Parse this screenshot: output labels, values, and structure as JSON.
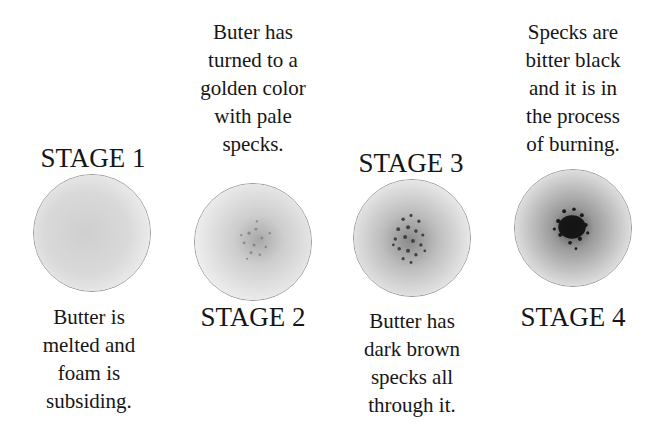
{
  "stages": [
    {
      "title": "STAGE 1",
      "description": "Butter is\nmelted and\nfoam is\nsubsiding.",
      "speck_color": "#b8b8b8",
      "speck_density": "none"
    },
    {
      "title": "STAGE 2",
      "description": "Buter has\nturned to a\ngolden color\nwith pale\nspecks.",
      "speck_color": "#8a8a8a",
      "speck_density": "light"
    },
    {
      "title": "STAGE 3",
      "description": "Butter has\ndark brown\nspecks all\nthrough it.",
      "speck_color": "#3a3a3a",
      "speck_density": "medium"
    },
    {
      "title": "STAGE 4",
      "description": "Specks are\nbitter black\nand it is in\nthe process\nof burning.",
      "speck_color": "#111111",
      "speck_density": "heavy"
    }
  ]
}
